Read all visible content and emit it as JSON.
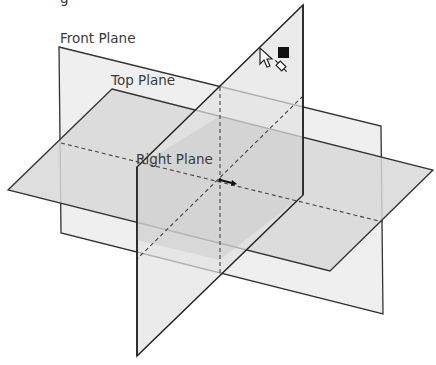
{
  "diagram": {
    "labels": {
      "front": "Front Plane",
      "top": "Top Plane",
      "right": "Right Plane",
      "partial_top": "g"
    },
    "colors": {
      "front_fill": "#eeeeee",
      "top_fill": "#d6d6d6",
      "right_fill": "#e4e4e4",
      "overlap_fill": "#c4c4c4",
      "edge": "#333333",
      "hidden_edge": "#444444"
    },
    "icons": [
      "cursor-arrow-icon",
      "plane-select-icon",
      "black-square-icon"
    ],
    "origin": {
      "x": 220,
      "y": 180
    }
  }
}
